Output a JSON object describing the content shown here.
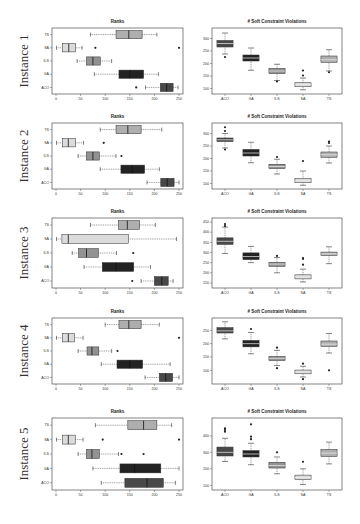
{
  "figure": {
    "row_labels": [
      "Instance 1",
      "Instance 2",
      "Instance 3",
      "Instance 4",
      "Instance 5"
    ],
    "left_title": "Ranks",
    "right_title": "# Soft Constraint Violations"
  },
  "colors": {
    "ACO": "#3a3a3a",
    "GA": "#111111",
    "ILS": "#8a8a8a",
    "SA": "#d8d8d8",
    "TS": "#a8a8a8",
    "frame": "#333333",
    "whisker": "#333333"
  },
  "chart_data": [
    {
      "type": "boxplot",
      "orientation": "horizontal",
      "instance": "Instance 1",
      "title": "Ranks",
      "categories": [
        "TS",
        "SA",
        "ILS",
        "GA",
        "ACO"
      ],
      "xlim": [
        0,
        250
      ],
      "xticks": [
        0,
        50,
        100,
        150,
        200,
        250
      ],
      "boxes": [
        {
          "name": "TS",
          "whislo": 70,
          "q1": 122,
          "med": 148,
          "q3": 175,
          "whishi": 205,
          "fliers": []
        },
        {
          "name": "SA",
          "whislo": 1,
          "q1": 13,
          "med": 26,
          "q3": 40,
          "whishi": 53,
          "fliers": [
            80,
            250
          ]
        },
        {
          "name": "ILS",
          "whislo": 43,
          "q1": 62,
          "med": 75,
          "q3": 90,
          "whishi": 113,
          "fliers": []
        },
        {
          "name": "GA",
          "whislo": 78,
          "q1": 128,
          "med": 150,
          "q3": 178,
          "whishi": 208,
          "fliers": []
        },
        {
          "name": "ACO",
          "whislo": 182,
          "q1": 212,
          "med": 225,
          "q3": 238,
          "whishi": 248,
          "fliers": [
            163
          ]
        }
      ]
    },
    {
      "type": "boxplot",
      "orientation": "vertical",
      "instance": "Instance 1",
      "title": "# Soft Constraint Violations",
      "categories": [
        "ACO",
        "GA",
        "ILS",
        "SA",
        "TS"
      ],
      "ylim": [
        90,
        330
      ],
      "yticks": [
        100,
        150,
        200,
        250,
        300
      ],
      "boxes": [
        {
          "name": "ACO",
          "whislo": 238,
          "q1": 266,
          "med": 280,
          "q3": 292,
          "whishi": 322,
          "fliers": [
            226
          ]
        },
        {
          "name": "GA",
          "whislo": 173,
          "q1": 210,
          "med": 222,
          "q3": 234,
          "whishi": 262,
          "fliers": []
        },
        {
          "name": "ILS",
          "whislo": 132,
          "q1": 160,
          "med": 170,
          "q3": 180,
          "whishi": 197,
          "fliers": [
            128
          ]
        },
        {
          "name": "SA",
          "whislo": 95,
          "q1": 107,
          "med": 115,
          "q3": 123,
          "whishi": 142,
          "fliers": [
            152,
            172
          ]
        },
        {
          "name": "TS",
          "whislo": 170,
          "q1": 205,
          "med": 215,
          "q3": 230,
          "whishi": 255,
          "fliers": [
            165
          ]
        }
      ]
    },
    {
      "type": "boxplot",
      "orientation": "horizontal",
      "instance": "Instance 2",
      "title": "Ranks",
      "categories": [
        "TS",
        "SA",
        "ILS",
        "GA",
        "ACO"
      ],
      "xlim": [
        0,
        250
      ],
      "xticks": [
        0,
        50,
        100,
        150,
        200,
        250
      ],
      "boxes": [
        {
          "name": "TS",
          "whislo": 90,
          "q1": 122,
          "med": 146,
          "q3": 173,
          "whishi": 215,
          "fliers": []
        },
        {
          "name": "SA",
          "whislo": 1,
          "q1": 13,
          "med": 25,
          "q3": 40,
          "whishi": 56,
          "fliers": [
            97
          ]
        },
        {
          "name": "ILS",
          "whislo": 45,
          "q1": 62,
          "med": 75,
          "q3": 88,
          "whishi": 122,
          "fliers": [
            133
          ]
        },
        {
          "name": "GA",
          "whislo": 90,
          "q1": 132,
          "med": 155,
          "q3": 180,
          "whishi": 210,
          "fliers": []
        },
        {
          "name": "ACO",
          "whislo": 185,
          "q1": 213,
          "med": 226,
          "q3": 240,
          "whishi": 250,
          "fliers": []
        }
      ]
    },
    {
      "type": "boxplot",
      "orientation": "vertical",
      "instance": "Instance 2",
      "title": "# Soft Constraint Violations",
      "categories": [
        "ACO",
        "GA",
        "ILS",
        "SA",
        "TS"
      ],
      "ylim": [
        90,
        330
      ],
      "yticks": [
        100,
        150,
        200,
        250,
        300
      ],
      "boxes": [
        {
          "name": "ACO",
          "whislo": 242,
          "q1": 268,
          "med": 275,
          "q3": 282,
          "whishi": 300,
          "fliers": [
            236,
            310,
            325
          ]
        },
        {
          "name": "GA",
          "whislo": 183,
          "q1": 210,
          "med": 222,
          "q3": 236,
          "whishi": 265,
          "fliers": []
        },
        {
          "name": "ILS",
          "whislo": 138,
          "q1": 160,
          "med": 168,
          "q3": 177,
          "whishi": 197,
          "fliers": [
            206
          ]
        },
        {
          "name": "SA",
          "whislo": 93,
          "q1": 103,
          "med": 110,
          "q3": 120,
          "whishi": 150,
          "fliers": [
            190
          ]
        },
        {
          "name": "TS",
          "whislo": 182,
          "q1": 205,
          "med": 215,
          "q3": 226,
          "whishi": 250,
          "fliers": [
            262,
            268
          ]
        }
      ]
    },
    {
      "type": "boxplot",
      "orientation": "horizontal",
      "instance": "Instance 3",
      "title": "Ranks",
      "categories": [
        "TS",
        "SA",
        "ILS",
        "GA",
        "ACO"
      ],
      "xlim": [
        0,
        250
      ],
      "xticks": [
        0,
        50,
        100,
        150,
        200,
        250
      ],
      "boxes": [
        {
          "name": "TS",
          "whislo": 70,
          "q1": 127,
          "med": 145,
          "q3": 170,
          "whishi": 202,
          "fliers": []
        },
        {
          "name": "SA",
          "whislo": 1,
          "q1": 12,
          "med": 25,
          "q3": 147,
          "whishi": 245,
          "fliers": []
        },
        {
          "name": "ILS",
          "whislo": 33,
          "q1": 46,
          "med": 62,
          "q3": 86,
          "whishi": 123,
          "fliers": [
            157
          ]
        },
        {
          "name": "GA",
          "whislo": 57,
          "q1": 94,
          "med": 122,
          "q3": 158,
          "whishi": 192,
          "fliers": []
        },
        {
          "name": "ACO",
          "whislo": 173,
          "q1": 200,
          "med": 215,
          "q3": 228,
          "whishi": 238,
          "fliers": [
            155
          ]
        }
      ]
    },
    {
      "type": "boxplot",
      "orientation": "vertical",
      "instance": "Instance 3",
      "title": "# Soft Constraint Violations",
      "categories": [
        "ACO",
        "GA",
        "ILS",
        "SA",
        "TS"
      ],
      "ylim": [
        140,
        455
      ],
      "yticks": [
        150,
        200,
        250,
        300,
        350,
        400,
        450
      ],
      "boxes": [
        {
          "name": "ACO",
          "whislo": 295,
          "q1": 340,
          "med": 355,
          "q3": 372,
          "whishi": 425,
          "fliers": [
            430,
            440
          ]
        },
        {
          "name": "GA",
          "whislo": 250,
          "q1": 265,
          "med": 280,
          "q3": 298,
          "whishi": 330,
          "fliers": []
        },
        {
          "name": "ILS",
          "whislo": 200,
          "q1": 232,
          "med": 243,
          "q3": 252,
          "whishi": 275,
          "fliers": [
            283
          ]
        },
        {
          "name": "SA",
          "whislo": 155,
          "q1": 170,
          "med": 180,
          "q3": 190,
          "whishi": 218,
          "fliers": [
            240,
            268,
            273
          ]
        },
        {
          "name": "TS",
          "whislo": 245,
          "q1": 285,
          "med": 293,
          "q3": 302,
          "whishi": 328,
          "fliers": []
        }
      ]
    },
    {
      "type": "boxplot",
      "orientation": "horizontal",
      "instance": "Instance 4",
      "title": "Ranks",
      "categories": [
        "TS",
        "SA",
        "ILS",
        "GA",
        "ACO"
      ],
      "xlim": [
        0,
        250
      ],
      "xticks": [
        0,
        50,
        100,
        150,
        200,
        250
      ],
      "boxes": [
        {
          "name": "TS",
          "whislo": 100,
          "q1": 128,
          "med": 148,
          "q3": 173,
          "whishi": 210,
          "fliers": []
        },
        {
          "name": "SA",
          "whislo": 1,
          "q1": 13,
          "med": 25,
          "q3": 38,
          "whishi": 55,
          "fliers": [
            250
          ]
        },
        {
          "name": "ILS",
          "whislo": 45,
          "q1": 63,
          "med": 73,
          "q3": 87,
          "whishi": 113,
          "fliers": [
            125
          ]
        },
        {
          "name": "GA",
          "whislo": 92,
          "q1": 124,
          "med": 150,
          "q3": 176,
          "whishi": 232,
          "fliers": []
        },
        {
          "name": "ACO",
          "whislo": 181,
          "q1": 210,
          "med": 223,
          "q3": 237,
          "whishi": 250,
          "fliers": []
        }
      ]
    },
    {
      "type": "boxplot",
      "orientation": "vertical",
      "instance": "Instance 4",
      "title": "# Soft Constraint Violations",
      "categories": [
        "ACO",
        "GA",
        "ILS",
        "SA",
        "TS"
      ],
      "ylim": [
        60,
        285
      ],
      "yticks": [
        100,
        150,
        200,
        250
      ],
      "boxes": [
        {
          "name": "ACO",
          "whislo": 218,
          "q1": 240,
          "med": 248,
          "q3": 260,
          "whishi": 282,
          "fliers": []
        },
        {
          "name": "GA",
          "whislo": 162,
          "q1": 188,
          "med": 200,
          "q3": 212,
          "whishi": 242,
          "fliers": [
            255
          ]
        },
        {
          "name": "ILS",
          "whislo": 118,
          "q1": 137,
          "med": 145,
          "q3": 152,
          "whishi": 175,
          "fliers": [
            108,
            185
          ]
        },
        {
          "name": "SA",
          "whislo": 75,
          "q1": 87,
          "med": 94,
          "q3": 101,
          "whishi": 115,
          "fliers": [
            67,
            125
          ]
        },
        {
          "name": "TS",
          "whislo": 165,
          "q1": 190,
          "med": 198,
          "q3": 210,
          "whishi": 238,
          "fliers": [
            100
          ]
        }
      ]
    },
    {
      "type": "boxplot",
      "orientation": "horizontal",
      "instance": "Instance 5",
      "title": "Ranks",
      "categories": [
        "TS",
        "SA",
        "ILS",
        "GA",
        "ACO"
      ],
      "xlim": [
        0,
        250
      ],
      "xticks": [
        0,
        50,
        100,
        150,
        200,
        250
      ],
      "boxes": [
        {
          "name": "TS",
          "whislo": 80,
          "q1": 146,
          "med": 178,
          "q3": 205,
          "whishi": 235,
          "fliers": []
        },
        {
          "name": "SA",
          "whislo": 1,
          "q1": 13,
          "med": 25,
          "q3": 39,
          "whishi": 55,
          "fliers": [
            95,
            250
          ]
        },
        {
          "name": "ILS",
          "whislo": 45,
          "q1": 62,
          "med": 73,
          "q3": 88,
          "whishi": 127,
          "fliers": [
            133,
            178
          ]
        },
        {
          "name": "GA",
          "whislo": 75,
          "q1": 130,
          "med": 160,
          "q3": 213,
          "whishi": 250,
          "fliers": []
        },
        {
          "name": "ACO",
          "whislo": 92,
          "q1": 140,
          "med": 185,
          "q3": 218,
          "whishi": 243,
          "fliers": []
        }
      ]
    },
    {
      "type": "boxplot",
      "orientation": "vertical",
      "instance": "Instance 5",
      "title": "# Soft Constraint Violations",
      "categories": [
        "ACO",
        "GA",
        "ILS",
        "SA",
        "TS"
      ],
      "ylim": [
        90,
        490
      ],
      "yticks": [
        100,
        200,
        300,
        400
      ],
      "boxes": [
        {
          "name": "ACO",
          "whislo": 245,
          "q1": 278,
          "med": 300,
          "q3": 332,
          "whishi": 385,
          "fliers": [
            425,
            435,
            445
          ]
        },
        {
          "name": "GA",
          "whislo": 225,
          "q1": 272,
          "med": 290,
          "q3": 310,
          "whishi": 355,
          "fliers": [
            380,
            395,
            470
          ]
        },
        {
          "name": "ILS",
          "whislo": 170,
          "q1": 205,
          "med": 220,
          "q3": 240,
          "whishi": 272,
          "fliers": [
            300
          ]
        },
        {
          "name": "SA",
          "whislo": 105,
          "q1": 135,
          "med": 148,
          "q3": 162,
          "whishi": 200,
          "fliers": [
            243
          ]
        },
        {
          "name": "TS",
          "whislo": 230,
          "q1": 275,
          "med": 295,
          "q3": 318,
          "whishi": 362,
          "fliers": []
        }
      ]
    }
  ]
}
